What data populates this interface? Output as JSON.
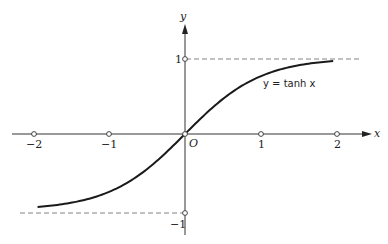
{
  "chart_data": {
    "type": "line",
    "title": "",
    "xlabel": "x",
    "ylabel": "y",
    "xlim": [
      -2.4,
      2.4
    ],
    "ylim": [
      -1.4,
      1.7
    ],
    "x_ticks": [
      -2,
      -1,
      1,
      2
    ],
    "x_tick_labels": [
      "−2",
      "−1",
      "1",
      "2"
    ],
    "y_ticks": [
      1,
      -1
    ],
    "y_tick_labels": [
      "1",
      "−1"
    ],
    "origin_label": "O",
    "series": [
      {
        "name": "y = tanh x",
        "function": "tanh",
        "x": [
          -1.94,
          -1.5,
          -1.0,
          -0.5,
          0,
          0.5,
          1.0,
          1.5,
          1.95
        ],
        "values": [
          -0.959,
          -0.905,
          -0.762,
          -0.462,
          0,
          0.462,
          0.762,
          0.905,
          0.961
        ]
      }
    ],
    "asymptotes": [
      {
        "y": 1,
        "style": "dashed",
        "x_range": [
          0,
          2.3
        ]
      },
      {
        "y": -1,
        "style": "dashed",
        "x_range": [
          -2.17,
          0
        ]
      }
    ],
    "annotations": [
      {
        "text": "y = tanh x",
        "x": 1.05,
        "y": 0.67
      }
    ],
    "grid": false,
    "legend": "none"
  },
  "labels": {
    "x_axis": "x",
    "y_axis": "y",
    "origin": "O",
    "curve": "y = tanh x",
    "tick_x_m2": "−2",
    "tick_x_m1": "−1",
    "tick_x_1": "1",
    "tick_x_2": "2",
    "tick_y_1": "1",
    "tick_y_m1": "−1"
  },
  "colors": {
    "ink": "#222222",
    "dash": "#777777",
    "background": "#ffffff"
  }
}
